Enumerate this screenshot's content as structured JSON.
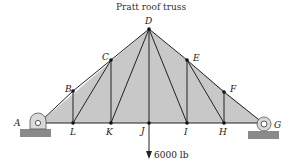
{
  "title": "Pratt roof truss",
  "colors": {
    "fill": "#c8c8c8",
    "member": "#222222",
    "ground": "#8a8a8a",
    "support": "#d9d9d9"
  },
  "nodes": {
    "A": {
      "label": "A",
      "x": 39,
      "y": 123
    },
    "B": {
      "label": "B",
      "x": 73,
      "y": 91
    },
    "C": {
      "label": "C",
      "x": 111,
      "y": 60
    },
    "D": {
      "label": "D",
      "x": 149,
      "y": 29
    },
    "E": {
      "label": "E",
      "x": 187,
      "y": 60
    },
    "F": {
      "label": "F",
      "x": 224,
      "y": 92
    },
    "G": {
      "label": "G",
      "x": 263,
      "y": 123
    },
    "H": {
      "label": "H",
      "x": 224,
      "y": 123
    },
    "I": {
      "label": "I",
      "x": 187,
      "y": 123
    },
    "J": {
      "label": "J",
      "x": 149,
      "y": 123
    },
    "K": {
      "label": "K",
      "x": 111,
      "y": 123
    },
    "L": {
      "label": "L",
      "x": 73,
      "y": 123
    }
  },
  "members": [
    "AB",
    "BC",
    "CD",
    "DE",
    "EF",
    "FG",
    "AL",
    "LK",
    "KJ",
    "JI",
    "IH",
    "HG",
    "BL",
    "CK",
    "DJ",
    "EI",
    "FH",
    "LC",
    "KD",
    "DI",
    "EH"
  ],
  "load": {
    "node": "J",
    "label": "6000 lb",
    "direction": "down"
  },
  "supports": [
    {
      "node": "A",
      "type": "pin"
    },
    {
      "node": "G",
      "type": "roller"
    }
  ]
}
